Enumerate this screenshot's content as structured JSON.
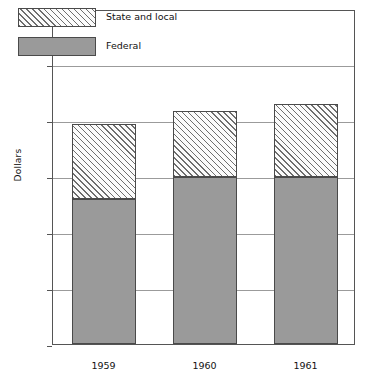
{
  "chart_data": {
    "type": "bar",
    "subtype": "stacked-bar",
    "title": "",
    "xlabel": "",
    "ylabel": "Dollars",
    "categories": [
      "1959",
      "1960",
      "1961"
    ],
    "series": [
      {
        "name": "Federal",
        "values": [
          390,
          450,
          450
        ]
      },
      {
        "name": "State and local",
        "values": [
          200,
          175,
          195
        ]
      }
    ],
    "totals": [
      590,
      625,
      645
    ],
    "ylim": [
      0,
      900
    ],
    "yticks": [
      0,
      150,
      300,
      450,
      600,
      750,
      900
    ],
    "ytick_labels": [
      "0",
      "150",
      "300",
      "450",
      "600",
      "750",
      "900"
    ],
    "grid": true,
    "legend_position": "top-left",
    "colors": {
      "federal": "#9a9a9a",
      "state_and_local": "#ffffff",
      "hatch": "#6e6e6e",
      "axis": "#555555",
      "gridline": "#9b9b9b",
      "text": "#111111"
    }
  },
  "axis": {
    "y_title": "Dollars",
    "y_labels": [
      "900",
      "750",
      "600",
      "450",
      "300",
      "150",
      "0"
    ],
    "x_labels": [
      "1959",
      "1960",
      "1961"
    ]
  },
  "legend": {
    "items": [
      {
        "label": "State and local",
        "swatch": "hatched"
      },
      {
        "label": "Federal",
        "swatch": "solid-gray"
      }
    ]
  }
}
